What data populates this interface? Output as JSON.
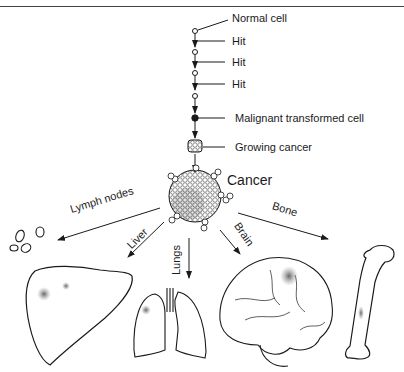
{
  "diagram": {
    "stages": [
      {
        "label": "Normal cell"
      },
      {
        "label": "Hit"
      },
      {
        "label": "Hit"
      },
      {
        "label": "Hit"
      },
      {
        "label": "Malignant transformed cell"
      },
      {
        "label": "Growing cancer"
      }
    ],
    "center": {
      "label": "Cancer"
    },
    "metastases": [
      {
        "label": "Lymph nodes",
        "target": "lymph-nodes"
      },
      {
        "label": "Liver",
        "target": "liver"
      },
      {
        "label": "Lungs",
        "target": "lungs"
      },
      {
        "label": "Brain",
        "target": "brain"
      },
      {
        "label": "Bone",
        "target": "bone"
      }
    ],
    "colors": {
      "ink": "#1a1a1a",
      "tumor_shade": "#6a6a6a",
      "background": "#ffffff"
    }
  }
}
